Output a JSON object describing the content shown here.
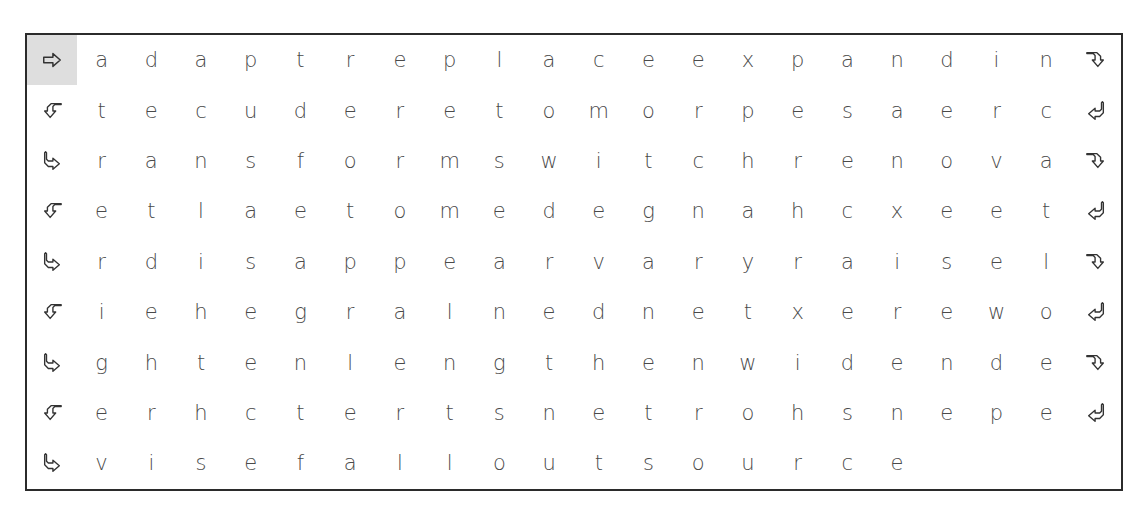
{
  "puzzle": {
    "highlight_color": "#dedede",
    "rows": [
      {
        "start_icon": "arrow-right-icon",
        "end_icon": "arrow-turn-down-right-icon",
        "letters": [
          "a",
          "d",
          "a",
          "p",
          "t",
          "r",
          "e",
          "p",
          "l",
          "a",
          "c",
          "e",
          "e",
          "x",
          "p",
          "a",
          "n",
          "d",
          "i",
          "n"
        ]
      },
      {
        "start_icon": "arrow-turn-left-icon",
        "end_icon": "arrow-turn-down-left-icon",
        "letters": [
          "t",
          "e",
          "c",
          "u",
          "d",
          "e",
          "r",
          "e",
          "t",
          "o",
          "m",
          "o",
          "r",
          "p",
          "e",
          "s",
          "a",
          "e",
          "r",
          "c"
        ]
      },
      {
        "start_icon": "arrow-turn-right-icon",
        "end_icon": "arrow-turn-down-right-icon",
        "letters": [
          "r",
          "a",
          "n",
          "s",
          "f",
          "o",
          "r",
          "m",
          "s",
          "w",
          "i",
          "t",
          "c",
          "h",
          "r",
          "e",
          "n",
          "o",
          "v",
          "a"
        ]
      },
      {
        "start_icon": "arrow-turn-left-icon",
        "end_icon": "arrow-turn-down-left-icon",
        "letters": [
          "e",
          "t",
          "l",
          "a",
          "e",
          "t",
          "o",
          "m",
          "e",
          "d",
          "e",
          "g",
          "n",
          "a",
          "h",
          "c",
          "x",
          "e",
          "e",
          "t"
        ]
      },
      {
        "start_icon": "arrow-turn-right-icon",
        "end_icon": "arrow-turn-down-right-icon",
        "letters": [
          "r",
          "d",
          "i",
          "s",
          "a",
          "p",
          "p",
          "e",
          "a",
          "r",
          "v",
          "a",
          "r",
          "y",
          "r",
          "a",
          "i",
          "s",
          "e",
          "l"
        ]
      },
      {
        "start_icon": "arrow-turn-left-icon",
        "end_icon": "arrow-turn-down-left-icon",
        "letters": [
          "i",
          "e",
          "h",
          "e",
          "g",
          "r",
          "a",
          "l",
          "n",
          "e",
          "d",
          "n",
          "e",
          "t",
          "x",
          "e",
          "r",
          "e",
          "w",
          "o"
        ]
      },
      {
        "start_icon": "arrow-turn-right-icon",
        "end_icon": "arrow-turn-down-right-icon",
        "letters": [
          "g",
          "h",
          "t",
          "e",
          "n",
          "l",
          "e",
          "n",
          "g",
          "t",
          "h",
          "e",
          "n",
          "w",
          "i",
          "d",
          "e",
          "n",
          "d",
          "e"
        ]
      },
      {
        "start_icon": "arrow-turn-left-icon",
        "end_icon": "arrow-turn-down-left-icon",
        "letters": [
          "e",
          "r",
          "h",
          "c",
          "t",
          "e",
          "r",
          "t",
          "s",
          "n",
          "e",
          "t",
          "r",
          "o",
          "h",
          "s",
          "n",
          "e",
          "p",
          "e"
        ]
      },
      {
        "start_icon": "arrow-turn-right-icon",
        "end_icon": null,
        "letters": [
          "v",
          "i",
          "s",
          "e",
          "f",
          "a",
          "l",
          "l",
          "o",
          "u",
          "t",
          "s",
          "o",
          "u",
          "r",
          "c",
          "e"
        ]
      }
    ]
  }
}
